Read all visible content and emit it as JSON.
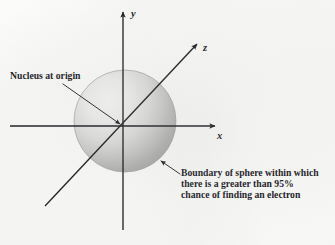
{
  "figure": {
    "background_color": "#fbfbfa",
    "ink_color": "#1b1b20"
  },
  "axes": {
    "y": {
      "label": "y",
      "name": "y-axis"
    },
    "x": {
      "label": "x",
      "name": "x-axis"
    },
    "z": {
      "label": "z",
      "name": "z-axis"
    }
  },
  "sphere": {
    "name": "electron-probability-sphere",
    "center_x": 125,
    "center_y": 121,
    "radius": 51,
    "highlight_color": "#f4f4f3",
    "midtone_color": "#d2d2d1",
    "shadow_color": "#a6a6a6",
    "rim_color": "#9a9a9a"
  },
  "callouts": {
    "nucleus": {
      "name": "nucleus-callout",
      "text": "Nucleus at origin"
    },
    "boundary": {
      "name": "boundary-callout",
      "line1": "Boundary of sphere within which",
      "line2": "there is a greater than 95%",
      "line3": "chance of finding an electron"
    }
  }
}
